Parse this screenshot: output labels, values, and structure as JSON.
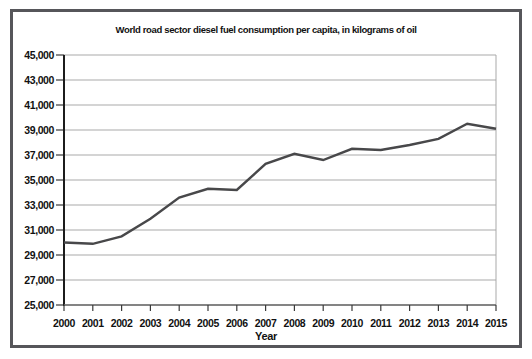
{
  "page": {
    "background": "#ffffff"
  },
  "chart_data": {
    "type": "line",
    "title": "World road sector diesel fuel consumption per capita, in kilograms of oil",
    "xlabel": "Year",
    "ylabel": "",
    "x": [
      2000,
      2001,
      2002,
      2003,
      2004,
      2005,
      2006,
      2007,
      2008,
      2009,
      2010,
      2011,
      2012,
      2013,
      2014,
      2015
    ],
    "x_labels": [
      "2000",
      "2001",
      "2002",
      "2003",
      "2004",
      "2005",
      "2006",
      "2007",
      "2008",
      "2009",
      "2010",
      "2011",
      "2012",
      "2013",
      "2014",
      "2015"
    ],
    "values": [
      30000,
      29900,
      30500,
      31900,
      33600,
      34300,
      34200,
      36300,
      37100,
      36600,
      37500,
      37400,
      37800,
      38300,
      39500,
      39100
    ],
    "ylim": [
      25000,
      45000
    ],
    "ytick_step": 2000,
    "ytick_values": [
      25000,
      27000,
      29000,
      31000,
      33000,
      35000,
      37000,
      39000,
      41000,
      43000,
      45000
    ],
    "ytick_labels": [
      "25,000",
      "27,000",
      "29,000",
      "31,000",
      "33,000",
      "35,000",
      "37,000",
      "39,000",
      "41,000",
      "43,000",
      "45,000"
    ],
    "grid": true,
    "legend": "none",
    "colors": {
      "line": "#48484a",
      "grid": "#a9a9a9",
      "axis_left": "#1c1c1c",
      "axis_bottom": "#6a6a6a",
      "tick": "#3a3a3a",
      "text": "#111111",
      "frame_border": "#56565a"
    }
  }
}
